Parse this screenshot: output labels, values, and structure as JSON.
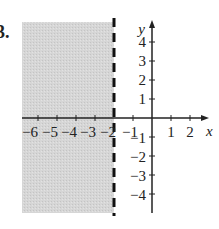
{
  "problem_number": "3.",
  "graph": {
    "type": "inequality-region",
    "inequality": "x < -2",
    "boundary": {
      "x": -2,
      "style": "dashed"
    },
    "shaded_side": "left",
    "x_axis": {
      "label": "x",
      "tick_labels": [
        "−6",
        "−5",
        "−4",
        "−3",
        "−2",
        "−1",
        "1",
        "2"
      ]
    },
    "y_axis": {
      "label": "y",
      "tick_labels": [
        "4",
        "3",
        "2",
        "1",
        "−1",
        "−2",
        "−3",
        "−4"
      ]
    },
    "colors": {
      "shade": "#d4d4d4",
      "axis": "#222222",
      "boundary": "#111111"
    }
  },
  "labels": {
    "x6": "−6",
    "x5": "−5",
    "x4": "−4",
    "x3": "−3",
    "x2": "−2",
    "x1": "−1",
    "xp1": "1",
    "xp2": "2",
    "xname": "x",
    "y4": "4",
    "y3": "3",
    "y2": "2",
    "y1": "1",
    "yn1": "−1",
    "yn2": "−2",
    "yn3": "−3",
    "yn4": "−4",
    "yname": "y"
  }
}
